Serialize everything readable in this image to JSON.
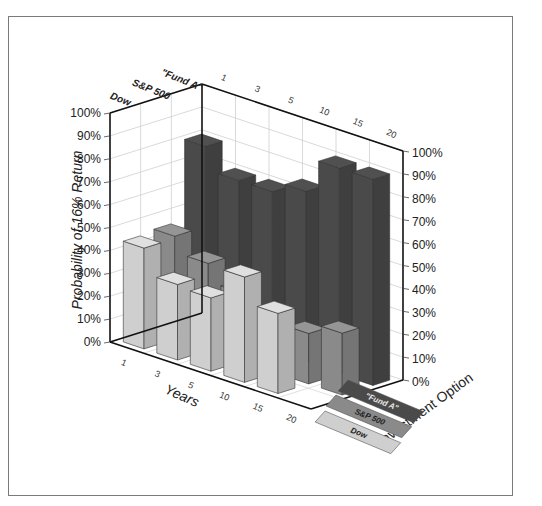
{
  "chart_data": {
    "type": "bar",
    "subtype": "3d-grouped-bar",
    "title": "",
    "xlabel": "Years",
    "ylabel": "Probability of 16% Return",
    "zlabel": "Investment Option",
    "categories": [
      "1",
      "3",
      "5",
      "10",
      "15",
      "20"
    ],
    "y_ticks": [
      "0%",
      "10%",
      "20%",
      "30%",
      "40%",
      "50%",
      "60%",
      "70%",
      "80%",
      "90%",
      "100%"
    ],
    "ylim": [
      0,
      100
    ],
    "grid": true,
    "legend_position": "bottom-right floor",
    "series": [
      {
        "name": "Dow",
        "color": "#cfcfcf",
        "values": [
          44,
          33,
          32,
          46,
          35,
          0
        ]
      },
      {
        "name": "S&P 500",
        "color": "#8a8a8a",
        "values": [
          45,
          38,
          30,
          20,
          22,
          27
        ]
      },
      {
        "name": "\"Fund A\"",
        "color": "#4a4a4a",
        "values": [
          80,
          70,
          70,
          75,
          90,
          90
        ]
      }
    ]
  },
  "labels": {
    "ylabel": "Probability of 16% Return",
    "xlabel": "Years",
    "zlabel": "Investment Option",
    "row_labels": [
      "Dow",
      "S&P 500",
      "\"Fund A\""
    ],
    "legend": [
      "\"Fund A\"",
      "S&P 500",
      "Dow"
    ]
  }
}
